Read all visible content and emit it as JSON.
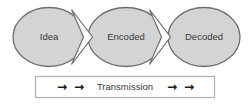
{
  "diagram": {
    "nodes": [
      {
        "id": "idea",
        "label": "Idea",
        "cx": 49,
        "cy": 37,
        "rx": 36,
        "ry": 29.5
      },
      {
        "id": "encoded",
        "label": "Encoded",
        "cx": 126,
        "cy": 37,
        "rx": 38,
        "ry": 29.5
      },
      {
        "id": "decoded",
        "label": "Decoded",
        "cx": 204,
        "cy": 37,
        "rx": 36,
        "ry": 29.5
      }
    ],
    "connectors": [
      {
        "id": "idea-to-encoded",
        "label": "arrow-notch",
        "x": 75,
        "y": 37
      },
      {
        "id": "encoded-to-decoded",
        "label": "arrow-notch",
        "x": 153,
        "y": 37
      }
    ],
    "transmission_bar": {
      "label": "Transmission",
      "left_arrows": [
        "→",
        "→"
      ],
      "right_arrows": [
        "→",
        "→"
      ],
      "x": 35,
      "y": 76,
      "width": 180,
      "height": 22
    },
    "colors": {
      "node_fill": "#d4d4d4",
      "node_stroke": "#6f6f6f",
      "node_text": "#3a3a3a",
      "notch_fill": "#ffffff",
      "notch_stroke": "#6f6f6f",
      "bar_fill": "#ffffff",
      "bar_stroke": "#b0b0b0",
      "bar_text": "#3a3a3a",
      "arrow_color": "#1a1a1a",
      "background": "#ffffff"
    }
  }
}
